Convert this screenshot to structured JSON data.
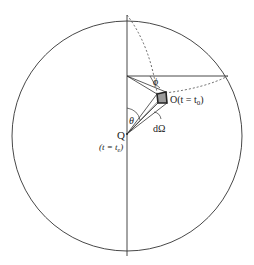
{
  "diagram": {
    "labels": {
      "point_o": "O(t = t",
      "point_o_sub": "0",
      "point_o_close": ")",
      "point_q": "Q",
      "point_q_time": "(t = t",
      "point_q_sub": "e",
      "point_q_close": ")",
      "angle_theta": "θ",
      "angle_phi": "ϕ",
      "solid_angle": "dΩ"
    },
    "colors": {
      "stroke": "#333333",
      "box_fill": "#9a9a9a",
      "background": "#ffffff"
    }
  }
}
